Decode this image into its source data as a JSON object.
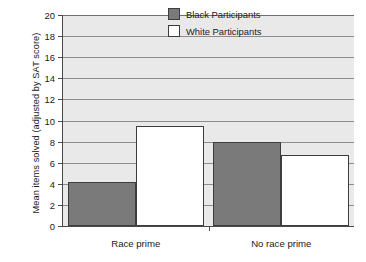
{
  "chart_data": {
    "type": "bar",
    "title": "",
    "subtitle": "",
    "xlabel": "",
    "ylabel": "Mean items solved (adjusted by SAT score)",
    "categories": [
      "Race prime",
      "No race prime"
    ],
    "series": [
      {
        "name": "Black Participants",
        "values": [
          4.2,
          8.0
        ],
        "color": "#7a7a7a"
      },
      {
        "name": "White Participants",
        "values": [
          9.5,
          6.7
        ],
        "color": "#ffffff"
      }
    ],
    "ylim": [
      0,
      20
    ],
    "ytick_step": 2,
    "yticks": [
      0,
      2,
      4,
      6,
      8,
      10,
      12,
      14,
      16,
      18,
      20
    ],
    "ytick_labels": [
      "0",
      "2",
      "4",
      "6",
      "8",
      "10",
      "12",
      "14",
      "16",
      "18",
      "20"
    ],
    "grid": true,
    "grid_axis": "y",
    "legend_position": "top-right",
    "legend": [
      "Black Participants",
      "White Participants"
    ],
    "plot_background": "#e9e9e9",
    "axis_color": "#4a4a4a",
    "gridline_color": "#8c8c8c",
    "bar_edge_color": "#3d3d3d"
  }
}
